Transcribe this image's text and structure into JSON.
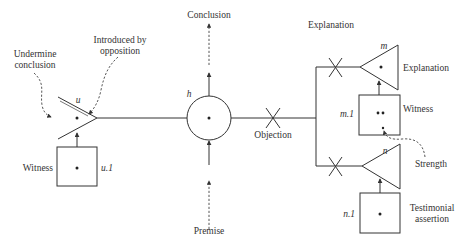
{
  "diagram": {
    "type": "argument-structure",
    "labels": {
      "undermine_line1": "Undermine",
      "undermine_line2": "conclusion",
      "introduced_line1": "Introduced by",
      "introduced_line2": "opposition",
      "witness_left": "Witness",
      "u_node": "u",
      "u1_node": "u.1",
      "h_node": "h",
      "conclusion": "Conclusion",
      "premise": "Premise",
      "objection": "Objection",
      "explanation_top": "Explanation",
      "m_node": "m",
      "explanation_right": "Explanation",
      "m1_node": "m.1",
      "witness_right": "Witness",
      "n_node": "n",
      "strength": "Strength",
      "n1_node": "n.1",
      "testimonial_line1": "Testimonial",
      "testimonial_line2": "assertion"
    },
    "colors": {
      "stroke": "#333333",
      "background": "#ffffff"
    }
  }
}
